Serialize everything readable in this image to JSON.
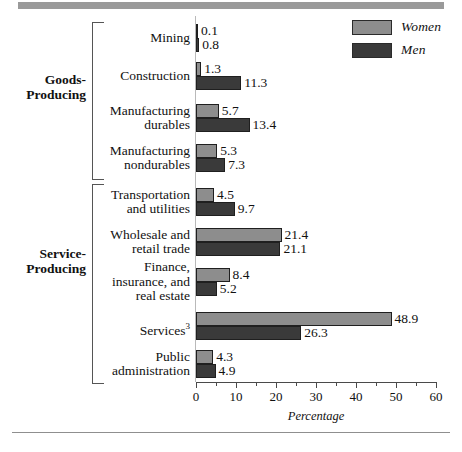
{
  "legend": {
    "items": [
      {
        "label": "Women",
        "color": "#8d8d8d",
        "name": "legend-women"
      },
      {
        "label": "Men",
        "color": "#3a3a3a",
        "name": "legend-men"
      }
    ]
  },
  "groups": [
    {
      "label_line1": "Goods-",
      "label_line2": "Producing"
    },
    {
      "label_line1": "Service-",
      "label_line2": "Producing"
    }
  ],
  "axis": {
    "title": "Percentage",
    "ticks": [
      "0",
      "10",
      "20",
      "30",
      "40",
      "50",
      "60"
    ]
  },
  "chart_data": {
    "type": "bar",
    "orientation": "horizontal",
    "title": "",
    "xlabel": "Percentage",
    "ylabel": "",
    "xlim": [
      0,
      60
    ],
    "grid": false,
    "legend_position": "top-right",
    "categories": [
      "Mining",
      "Construction",
      "Manufacturing durables",
      "Manufacturing nondurables",
      "Transportation and utilities",
      "Wholesale and retail trade",
      "Finance, insurance, and real estate",
      "Services",
      "Public administration"
    ],
    "category_lines": [
      [
        "Mining"
      ],
      [
        "Construction"
      ],
      [
        "Manufacturing",
        "durables"
      ],
      [
        "Manufacturing",
        "nondurables"
      ],
      [
        "Transportation",
        "and utilities"
      ],
      [
        "Wholesale and",
        "retail trade"
      ],
      [
        "Finance,",
        "insurance, and",
        "real estate"
      ],
      [
        "Services"
      ],
      [
        "Public",
        "administration"
      ]
    ],
    "category_footnotes": [
      "",
      "",
      "",
      "",
      "",
      "",
      "",
      "3",
      ""
    ],
    "group_assignment": [
      "Goods-Producing",
      "Goods-Producing",
      "Goods-Producing",
      "Goods-Producing",
      "Service-Producing",
      "Service-Producing",
      "Service-Producing",
      "Service-Producing",
      "Service-Producing"
    ],
    "series": [
      {
        "name": "Women",
        "color": "#8d8d8d",
        "values": [
          0.1,
          1.3,
          5.7,
          5.3,
          4.5,
          21.4,
          8.4,
          48.9,
          4.3
        ]
      },
      {
        "name": "Men",
        "color": "#3a3a3a",
        "values": [
          0.8,
          11.3,
          13.4,
          7.3,
          9.7,
          21.1,
          5.2,
          26.3,
          4.9
        ]
      }
    ]
  }
}
